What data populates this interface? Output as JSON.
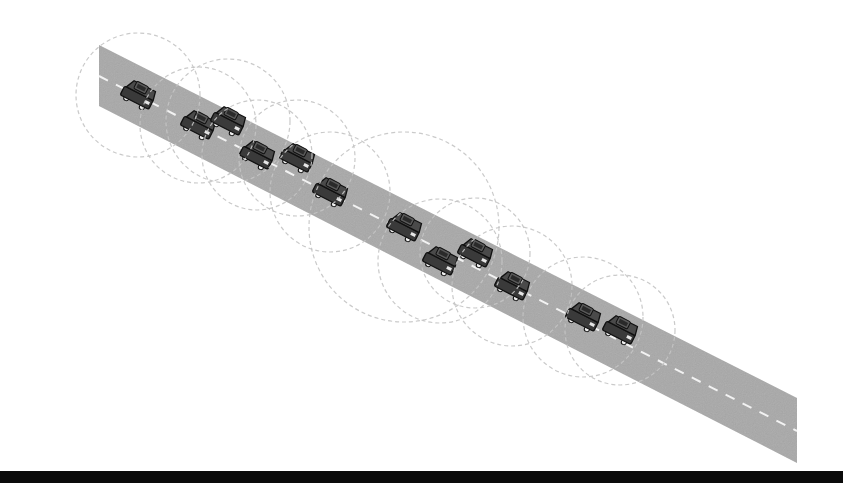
{
  "diagram": {
    "colors": {
      "background": "#ffffff",
      "road": "#a8a8a8",
      "lane_marking": "#f2f2f2",
      "range_circle": "#c4c4c4",
      "car_body": "#3a3a3a",
      "car_roof": "#5a5a5a",
      "car_outline": "#111111",
      "bottom_bar": "#0a0a0a"
    },
    "road": {
      "polygon": [
        [
          99,
          45
        ],
        [
          797,
          398
        ],
        [
          797,
          463
        ],
        [
          99,
          106
        ]
      ],
      "center_line": [
        [
          99,
          76
        ],
        [
          797,
          431
        ]
      ]
    },
    "vehicles": [
      {
        "id": 1,
        "x": 138,
        "y": 95,
        "range": 62
      },
      {
        "id": 2,
        "x": 198,
        "y": 125,
        "range": 58
      },
      {
        "id": 3,
        "x": 228,
        "y": 121,
        "range": 62
      },
      {
        "id": 4,
        "x": 257,
        "y": 155,
        "range": 55
      },
      {
        "id": 5,
        "x": 297,
        "y": 158,
        "range": 58
      },
      {
        "id": 6,
        "x": 330,
        "y": 192,
        "range": 60
      },
      {
        "id": 7,
        "x": 404,
        "y": 227,
        "range": 95
      },
      {
        "id": 8,
        "x": 440,
        "y": 261,
        "range": 62
      },
      {
        "id": 9,
        "x": 475,
        "y": 253,
        "range": 55
      },
      {
        "id": 10,
        "x": 512,
        "y": 286,
        "range": 60
      },
      {
        "id": 11,
        "x": 583,
        "y": 317,
        "range": 60
      },
      {
        "id": 12,
        "x": 620,
        "y": 330,
        "range": 55
      }
    ]
  }
}
